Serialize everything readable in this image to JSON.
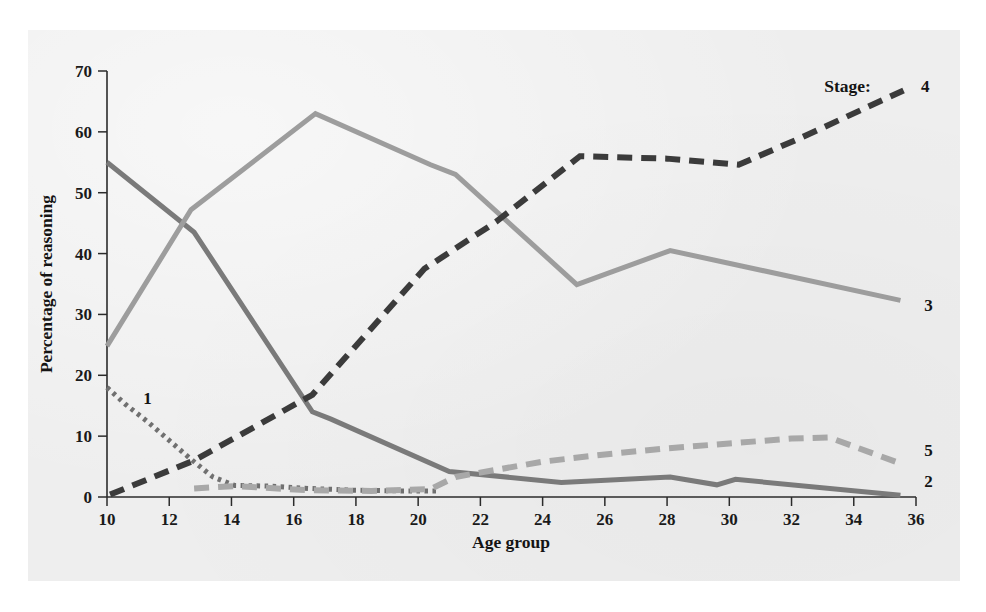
{
  "figure": {
    "background_color": "#ffffff",
    "panel_color": "#eeeeee",
    "legend_title": "Stage:"
  },
  "chart_data": {
    "type": "line",
    "title": "",
    "subtitle": "",
    "xlabel": "Age group",
    "ylabel": "Percentage of reasoning",
    "xlim": [
      10,
      36
    ],
    "ylim": [
      0,
      70
    ],
    "xticks": [
      10,
      12,
      14,
      16,
      18,
      20,
      22,
      24,
      26,
      28,
      30,
      32,
      34,
      36
    ],
    "yticks": [
      0,
      10,
      20,
      30,
      40,
      50,
      60,
      70
    ],
    "xtick_labels": [
      "10",
      "12",
      "14",
      "16",
      "18",
      "20",
      "22",
      "24",
      "26",
      "28",
      "30",
      "32",
      "34",
      "36"
    ],
    "ytick_labels": [
      "0",
      "10",
      "20",
      "30",
      "40",
      "50",
      "60",
      "70"
    ],
    "grid": false,
    "legend_position": "right-of-line-ends",
    "legend_title": "Stage:",
    "annotations": [
      {
        "text": "Stage:",
        "x": 33.8,
        "y": 67.5
      },
      {
        "text": "4",
        "x": 36.3,
        "y": 67.5
      },
      {
        "text": "3",
        "x": 36.4,
        "y": 31.5
      },
      {
        "text": "5",
        "x": 36.4,
        "y": 7.8
      },
      {
        "text": "2",
        "x": 36.4,
        "y": 2.6
      },
      {
        "text": "1",
        "x": 11.3,
        "y": 16.2
      }
    ],
    "series": [
      {
        "name": "1",
        "label": "Stage 1",
        "color": "#707070",
        "style": "dotted",
        "x": [
          10.0,
          10.6,
          11.3,
          12.0,
          12.7,
          13.4,
          14.1,
          15.2,
          16.5,
          18.0,
          19.5,
          20.6
        ],
        "values": [
          18.0,
          15.2,
          12.4,
          9.3,
          6.2,
          3.3,
          1.9,
          1.8,
          1.4,
          1.1,
          1.0,
          1.0
        ]
      },
      {
        "name": "2",
        "label": "Stage 2",
        "color": "#7a7a7a",
        "style": "solid",
        "x": [
          10.0,
          12.8,
          16.6,
          17.2,
          21.0,
          24.6,
          28.1,
          29.6,
          30.2,
          35.5
        ],
        "values": [
          55.0,
          43.5,
          14.0,
          12.8,
          4.2,
          2.4,
          3.3,
          2.0,
          2.9,
          0.3
        ]
      },
      {
        "name": "3",
        "label": "Stage 3",
        "color": "#9d9d9d",
        "style": "solid",
        "x": [
          10.0,
          12.7,
          16.7,
          20.4,
          21.2,
          25.1,
          28.1,
          35.5
        ],
        "values": [
          24.8,
          47.2,
          63.0,
          54.6,
          53.0,
          34.9,
          40.5,
          32.3
        ]
      },
      {
        "name": "4",
        "label": "Stage 4",
        "color": "#3b3b3b",
        "style": "dashed",
        "x": [
          10.1,
          12.8,
          16.6,
          20.2,
          22.5,
          25.2,
          28.0,
          30.3,
          32.2,
          35.6
        ],
        "values": [
          0.4,
          6.0,
          16.8,
          37.5,
          45.2,
          56.0,
          55.6,
          54.6,
          58.8,
          66.8
        ]
      },
      {
        "name": "5",
        "label": "Stage 5",
        "color": "#a8a8a8",
        "style": "dashed",
        "x": [
          12.8,
          14.1,
          16.5,
          18.5,
          20.4,
          21.2,
          24.0,
          26.0,
          28.0,
          30.0,
          32.0,
          33.2,
          35.4
        ],
        "values": [
          1.4,
          1.8,
          1.1,
          1.0,
          1.3,
          3.3,
          5.8,
          7.0,
          8.0,
          8.8,
          9.6,
          9.8,
          5.7
        ]
      }
    ]
  }
}
